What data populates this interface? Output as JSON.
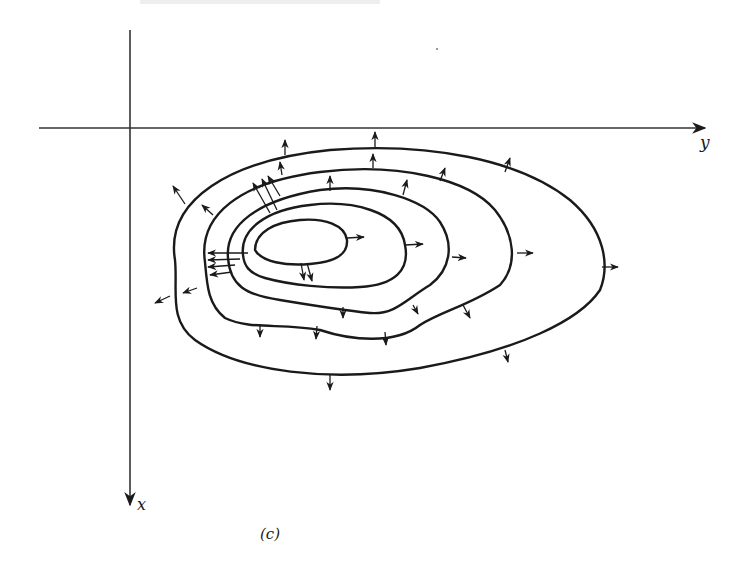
{
  "figure": {
    "caption": "(c)",
    "axes": {
      "horizontal": {
        "label": "y",
        "direction": "right"
      },
      "vertical": {
        "label": "x",
        "direction": "down"
      }
    },
    "contour_count": 5,
    "colors": {
      "line": "#1a1a1a",
      "axis": "#333333",
      "background": "#ffffff"
    }
  }
}
